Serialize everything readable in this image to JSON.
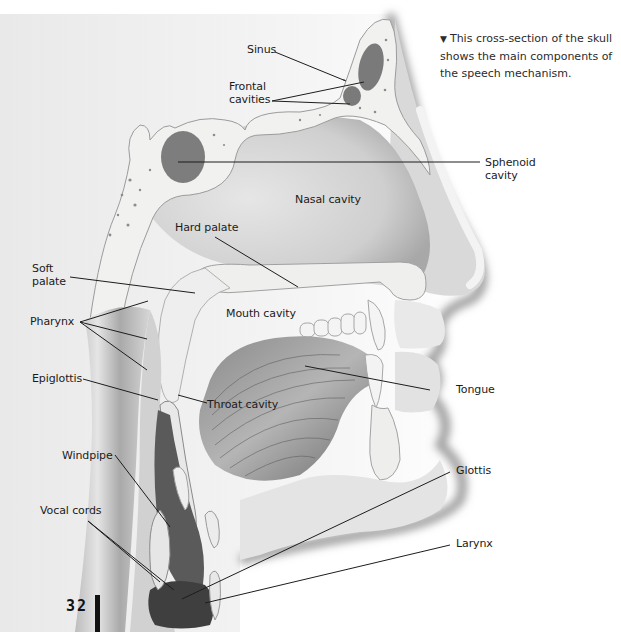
{
  "caption": {
    "marker": "▼",
    "text": "This cross-section of the skull shows the main components of the speech mechanism."
  },
  "page_number": "32",
  "figure": {
    "labels": {
      "sinus": "Sinus",
      "frontal_cavities": "Frontal\ncavities",
      "sphenoid_cavity": "Sphenoid\ncavity",
      "nasal_cavity": "Nasal cavity",
      "hard_palate": "Hard palate",
      "soft_palate": "Soft\npalate",
      "pharynx": "Pharynx",
      "mouth_cavity": "Mouth cavity",
      "epiglottis": "Epiglottis",
      "throat_cavity": "Throat cavity",
      "tongue": "Tongue",
      "windpipe": "Windpipe",
      "glottis": "Glottis",
      "vocal_cords": "Vocal cords",
      "larynx": "Larynx"
    }
  },
  "colors": {
    "background": "#ffffff",
    "skin_shadow": "#9a9a9a",
    "bone": "#f2f2f0",
    "cavity": "#7a7a7a",
    "tissue": "#d8d8d8",
    "label_text": "#1b1b1b"
  }
}
